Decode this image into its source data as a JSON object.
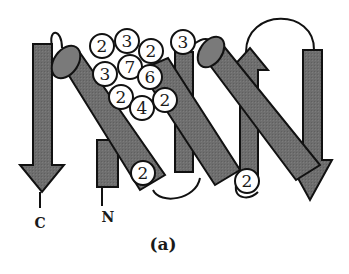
{
  "figure": {
    "caption": "(a)",
    "terminus_labels": {
      "c": "C",
      "n": "N"
    },
    "colors": {
      "fill": "#6e6e6e",
      "fill_light": "#8a8a8a",
      "stroke": "#111111",
      "circle_fill": "#ffffff",
      "background": "#ffffff"
    }
  },
  "strands": [
    {
      "id": "strand-c-term",
      "direction": "down",
      "label": "C"
    },
    {
      "id": "strand-n-term",
      "direction": "up",
      "label": "N"
    },
    {
      "id": "strand-middle",
      "direction": "up"
    },
    {
      "id": "strand-upper-middle",
      "direction": "up"
    },
    {
      "id": "strand-right",
      "direction": "down"
    }
  ],
  "helices": [
    {
      "id": "helix-1"
    },
    {
      "id": "helix-2"
    },
    {
      "id": "helix-3"
    }
  ],
  "markers": [
    {
      "value": "2",
      "x": 102,
      "y": 46
    },
    {
      "value": "3",
      "x": 127,
      "y": 41
    },
    {
      "value": "2",
      "x": 151,
      "y": 51
    },
    {
      "value": "3",
      "x": 183,
      "y": 42
    },
    {
      "value": "3",
      "x": 105,
      "y": 74
    },
    {
      "value": "7",
      "x": 130,
      "y": 67
    },
    {
      "value": "6",
      "x": 150,
      "y": 77
    },
    {
      "value": "2",
      "x": 121,
      "y": 97
    },
    {
      "value": "4",
      "x": 142,
      "y": 108
    },
    {
      "value": "2",
      "x": 165,
      "y": 100
    },
    {
      "value": "2",
      "x": 143,
      "y": 173
    },
    {
      "value": "2",
      "x": 247,
      "y": 181
    }
  ]
}
